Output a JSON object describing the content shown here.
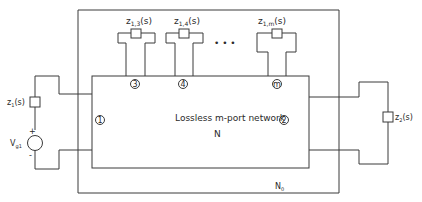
{
  "diagram": {
    "outer_network_label": "N",
    "outer_network_sub": "0",
    "inner_network": {
      "title": "Lossless m-port network",
      "name": "N"
    },
    "ports": [
      {
        "id": "1",
        "label": "1"
      },
      {
        "id": "2",
        "label": "2"
      },
      {
        "id": "3",
        "label": "3"
      },
      {
        "id": "4",
        "label": "4"
      },
      {
        "id": "m",
        "label": "m"
      }
    ],
    "ellipsis": "• • •",
    "source": {
      "label": "V",
      "sub": "g1",
      "plus": "+",
      "minus": "-"
    },
    "impedances": [
      {
        "name": "z",
        "sub": "1",
        "arg": "(s)"
      },
      {
        "name": "z",
        "sub": "2",
        "arg": "(s)"
      },
      {
        "name": "z",
        "sub": "1,3",
        "arg": "(s)"
      },
      {
        "name": "z",
        "sub": "1,4",
        "arg": "(s)"
      },
      {
        "name": "z",
        "sub": "1,m",
        "arg": "(s)"
      }
    ],
    "colors": {
      "line": "#3a3a3a",
      "text": "#2a2a2a",
      "background": "#ffffff"
    }
  }
}
